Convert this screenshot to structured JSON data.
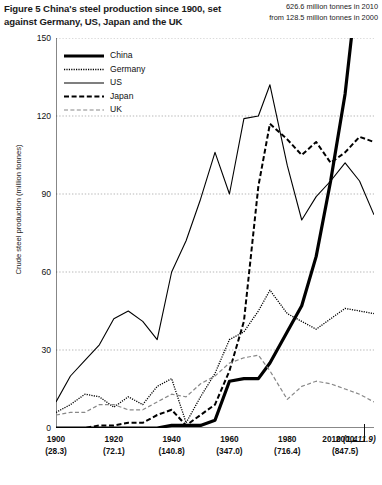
{
  "figure": {
    "title": "Figure 5 China's steel production since 1900, set against Germany, US, Japan and the UK",
    "annotation_line1": "626.6 million tonnes in 2010",
    "annotation_line2": "from 128.5 million tonnes in 2000"
  },
  "chart_data": {
    "type": "line",
    "title": "Figure 5 China's steel production since 1900, set against Germany, US, Japan and the UK",
    "xlabel": "",
    "ylabel": "Crude steel production (million tonnes)",
    "ylim": [
      0,
      150
    ],
    "xlim": [
      1900,
      2010
    ],
    "yticks": [
      0,
      30,
      60,
      90,
      120,
      150
    ],
    "grid": "horizontal-dotted",
    "legend_position": "top-left inside plot",
    "xticks": [
      {
        "year": "1900",
        "world": "(28.3)"
      },
      {
        "year": "1920",
        "world": "(72.1)"
      },
      {
        "year": "1940",
        "world": "(140.8)"
      },
      {
        "year": "1960",
        "world": "(347.0)"
      },
      {
        "year": "1980",
        "world": "(716.4)"
      },
      {
        "year": "2000",
        "world": "(847.5)"
      },
      {
        "year": "2010",
        "world": "(1,411.9)"
      }
    ],
    "xtick_note": "Values in brackets are world crude steel production in million tonnes",
    "annotations": [
      {
        "text": "626.6 million tonnes in 2010",
        "target": "China 2010"
      },
      {
        "text": "from 128.5 million tonnes in 2000",
        "target": "China 2000"
      }
    ],
    "x": [
      1900,
      1905,
      1910,
      1915,
      1920,
      1925,
      1930,
      1935,
      1940,
      1945,
      1950,
      1955,
      1960,
      1965,
      1970,
      1974,
      1980,
      1985,
      1990,
      1995,
      2000,
      2005,
      2010
    ],
    "series": [
      {
        "name": "China",
        "style": "thick-solid",
        "color": "#000000",
        "values": [
          0,
          0,
          0,
          0,
          0,
          0,
          0,
          0,
          1,
          1,
          1,
          3,
          18,
          19,
          19,
          25,
          37,
          47,
          66,
          95,
          128.5,
          355,
          626.6
        ]
      },
      {
        "name": "Germany",
        "style": "dotted",
        "color": "#000000",
        "values": [
          6,
          9,
          13,
          12,
          8,
          12,
          9,
          16,
          19,
          2,
          12,
          21,
          34,
          37,
          45,
          53,
          44,
          41,
          38,
          42,
          46,
          45,
          44
        ]
      },
      {
        "name": "US",
        "style": "thin-solid",
        "color": "#000000",
        "values": [
          10,
          20,
          26,
          32,
          42,
          45,
          41,
          34,
          60,
          72,
          88,
          106,
          90,
          119,
          120,
          132,
          101,
          80,
          89,
          95,
          102,
          95,
          82
        ]
      },
      {
        "name": "Japan",
        "style": "bold-dashed",
        "color": "#000000",
        "values": [
          0,
          0,
          0,
          1,
          1,
          2,
          2,
          5,
          7,
          1,
          5,
          9,
          22,
          41,
          93,
          117,
          111,
          105,
          110,
          102,
          106,
          112,
          110
        ]
      },
      {
        "name": "UK",
        "style": "light-dashed",
        "color": "#777777",
        "values": [
          5,
          6,
          6,
          9,
          9,
          7,
          7,
          10,
          13,
          12,
          17,
          20,
          25,
          27,
          28,
          22,
          11,
          16,
          18,
          17,
          15,
          13,
          10
        ]
      }
    ]
  },
  "legend": [
    {
      "label": "China",
      "style": "thick-solid"
    },
    {
      "label": "Germany",
      "style": "dotted"
    },
    {
      "label": "US",
      "style": "thin-solid"
    },
    {
      "label": "Japan",
      "style": "bold-dashed"
    },
    {
      "label": "UK",
      "style": "light-dashed"
    }
  ]
}
